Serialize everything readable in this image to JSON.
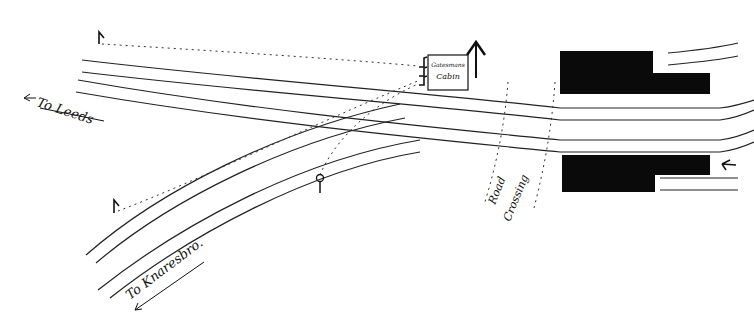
{
  "diagram": {
    "type": "railway junction sketch",
    "colors": {
      "ink": "#111111",
      "paper": "#ffffff",
      "building": "#0a0a0a"
    },
    "labels": {
      "to_leeds": "To Leeds",
      "to_knaresbro": "To Knaresbro.",
      "cabin_line1": "Gatesmans",
      "cabin_line2": "Cabin",
      "road_line1": "Road",
      "road_line2": "Crossing"
    },
    "elements": {
      "signals": [
        "signal-top-left",
        "signal-lower-left",
        "signal-disc-center",
        "signal-tall-cabin",
        "signal-right-arrow"
      ],
      "buildings": [
        "station-building-north",
        "station-building-south"
      ],
      "cabin": "gatesmans-cabin",
      "crossing": "road-crossing"
    }
  }
}
